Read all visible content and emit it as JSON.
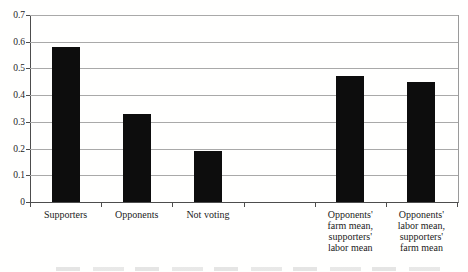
{
  "chart_data": {
    "type": "bar",
    "title": "",
    "xlabel": "",
    "ylabel": "",
    "categories": [
      "Supporters",
      "Opponents",
      "Not voting",
      "",
      "Opponents' farm mean, supporters' labor mean",
      "Opponents' labor mean, supporters' farm mean"
    ],
    "values": [
      0.58,
      0.33,
      0.19,
      null,
      0.47,
      0.45
    ],
    "xtick_label_lines": [
      [
        "Supporters"
      ],
      [
        "Opponents"
      ],
      [
        "Not voting"
      ],
      [],
      [
        "Opponents'",
        "farm mean,",
        "supporters'",
        "labor mean"
      ],
      [
        "Opponents'",
        "labor mean,",
        "supporters'",
        "farm mean"
      ]
    ],
    "ylim": [
      0,
      0.7
    ],
    "ytick_interval": 0.1,
    "yticks": [
      "0.7",
      "0.6",
      "0.5",
      "0.4",
      "0.3",
      "0.2",
      "0.1",
      "0"
    ],
    "grid": true,
    "legend": null,
    "colors": {
      "bar": "#0d0d0d",
      "gridline": "#a9a9a9",
      "axis": "#4d4d4d",
      "text": "#1c1c1c",
      "background": "#ffffff"
    }
  }
}
